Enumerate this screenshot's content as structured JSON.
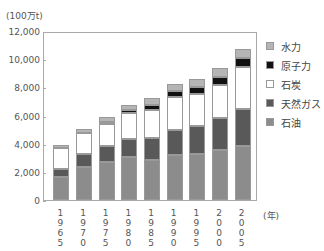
{
  "chart_data": {
    "type": "bar",
    "stacked": true,
    "title": "",
    "unit_label": "(100万t)",
    "xlabel": "(年)",
    "ylabel": "(100万t)",
    "ylim": [
      0,
      12000
    ],
    "yticks": [
      "0",
      "2,000",
      "4,000",
      "6,000",
      "8,000",
      "10,000",
      "12,000"
    ],
    "categories": [
      "1965",
      "1970",
      "1975",
      "1980",
      "1985",
      "1990",
      "1995",
      "2000",
      "2005"
    ],
    "series": [
      {
        "name": "石油",
        "color": "#8c8c8c",
        "values": [
          1600,
          2350,
          2700,
          3050,
          2850,
          3200,
          3250,
          3550,
          3850
        ]
      },
      {
        "name": "天然ガス",
        "color": "#595959",
        "values": [
          600,
          900,
          1130,
          1280,
          1550,
          1750,
          2000,
          2250,
          2600
        ]
      },
      {
        "name": "石炭",
        "color": "#ffffff",
        "values": [
          1500,
          1500,
          1570,
          1870,
          2000,
          2350,
          2250,
          2350,
          3000
        ]
      },
      {
        "name": "原子力",
        "color": "#111111",
        "values": [
          0,
          0,
          150,
          200,
          350,
          450,
          550,
          600,
          600
        ]
      },
      {
        "name": "水力",
        "color": "#b5b5b5",
        "values": [
          200,
          300,
          350,
          350,
          500,
          500,
          550,
          600,
          650
        ]
      }
    ],
    "grid": false,
    "legend_position": "right"
  },
  "legend": {
    "items": [
      {
        "label": "水力",
        "color": "#b5b5b5"
      },
      {
        "label": "原子力",
        "color": "#111111"
      },
      {
        "label": "石炭",
        "color": "#ffffff"
      },
      {
        "label": "天然ガス",
        "color": "#595959"
      },
      {
        "label": "石油",
        "color": "#8c8c8c"
      }
    ]
  },
  "x_labels": [
    [
      "1",
      "9",
      "6",
      "5"
    ],
    [
      "1",
      "9",
      "7",
      "0"
    ],
    [
      "1",
      "9",
      "7",
      "5"
    ],
    [
      "1",
      "9",
      "8",
      "0"
    ],
    [
      "1",
      "9",
      "8",
      "5"
    ],
    [
      "1",
      "9",
      "9",
      "0"
    ],
    [
      "1",
      "9",
      "9",
      "5"
    ],
    [
      "2",
      "0",
      "0",
      "0"
    ],
    [
      "2",
      "0",
      "0",
      "5"
    ]
  ]
}
